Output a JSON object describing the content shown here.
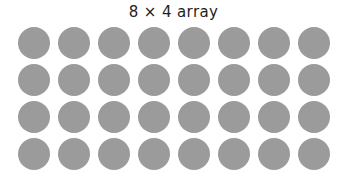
{
  "figure": {
    "title": "8 × 4 array",
    "background_color": "#ffffff",
    "title_color": "#231f20"
  },
  "chart_data": {
    "type": "scatter",
    "title": "8 × 4 array",
    "subtitle": "",
    "xlabel": "",
    "ylabel": "",
    "columns": 8,
    "rows": 4,
    "total_dots": 32,
    "dot_color": "#9b9b9b",
    "dot_diameter_px": 32,
    "column_pitch_px": 40,
    "row_pitch_px": 37,
    "grid_origin_px": [
      18,
      27
    ],
    "grid_extent_px": [
      332,
      169
    ],
    "legend": [],
    "grid": false,
    "column_labels": [
      "1",
      "2",
      "3",
      "4",
      "5",
      "6",
      "7",
      "8"
    ],
    "row_labels": [
      "1",
      "2",
      "3",
      "4"
    ],
    "matrix": [
      [
        1,
        1,
        1,
        1,
        1,
        1,
        1,
        1
      ],
      [
        1,
        1,
        1,
        1,
        1,
        1,
        1,
        1
      ],
      [
        1,
        1,
        1,
        1,
        1,
        1,
        1,
        1
      ],
      [
        1,
        1,
        1,
        1,
        1,
        1,
        1,
        1
      ]
    ],
    "x": [
      [
        1,
        2,
        3,
        4,
        5,
        6,
        7,
        8
      ],
      [
        1,
        2,
        3,
        4,
        5,
        6,
        7,
        8
      ],
      [
        1,
        2,
        3,
        4,
        5,
        6,
        7,
        8
      ],
      [
        1,
        2,
        3,
        4,
        5,
        6,
        7,
        8
      ]
    ],
    "y": [
      [
        1,
        1,
        1,
        1,
        1,
        1,
        1,
        1
      ],
      [
        2,
        2,
        2,
        2,
        2,
        2,
        2,
        2
      ],
      [
        3,
        3,
        3,
        3,
        3,
        3,
        3,
        3
      ],
      [
        4,
        4,
        4,
        4,
        4,
        4,
        4,
        4
      ]
    ],
    "xlim": [
      0,
      9
    ],
    "ylim": [
      0,
      5
    ]
  }
}
